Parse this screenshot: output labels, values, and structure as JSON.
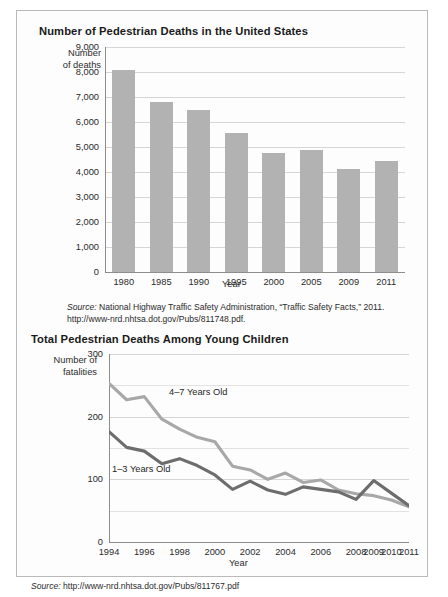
{
  "bar_section": {
    "title": "Number of Pedestrian Deaths in the United States",
    "y_caption_line1": "Number",
    "y_caption_line2": "of deaths",
    "x_axis_title": "Year",
    "source_line1": "Source: National Highway Traffic Safety Administration, “Traffic Safety Facts,” 2011.",
    "source_line2": "http://www-nrd.nhtsa.dot.gov/Pubs/811748.pdf.",
    "source_prefix": "Source:"
  },
  "line_section": {
    "title": "Total Pedestrian Deaths Among Young Children",
    "y_caption_line1": "Number of",
    "y_caption_line2": "fatalities",
    "x_axis_title": "Year",
    "label_older": "4–7 Years Old",
    "label_younger": "1–3 Years Old",
    "source_line1": "Source: http://www-nrd.nhtsa.dot.gov/Pubs/811767.pdf",
    "source_prefix": "Source:"
  },
  "colors": {
    "bar_fill": "#b2b2b2",
    "line_older": "#a8a8a8",
    "line_younger": "#6d6d6d",
    "grid": "#d6d6d6",
    "axis": "#8d8d8d",
    "border": "#b9b9b9",
    "text": "#231f20"
  },
  "chart_data": [
    {
      "type": "bar",
      "title": "Number of Pedestrian Deaths in the United States",
      "xlabel": "Year",
      "ylabel": "Number of deaths",
      "categories": [
        "1980",
        "1985",
        "1990",
        "1995",
        "2000",
        "2005",
        "2009",
        "2011"
      ],
      "values": [
        8070,
        6800,
        6480,
        5580,
        4760,
        4890,
        4110,
        4430
      ],
      "ylim": [
        0,
        9000
      ],
      "yticks": [
        0,
        1000,
        2000,
        3000,
        4000,
        5000,
        6000,
        7000,
        8000,
        9000
      ],
      "ytick_labels": [
        "0",
        "1,000",
        "2,000",
        "3,000",
        "4,000",
        "5,000",
        "6,000",
        "7,000",
        "8,000",
        "9,000"
      ],
      "grid": true,
      "legend": "none"
    },
    {
      "type": "line",
      "title": "Total Pedestrian Deaths Among Young Children",
      "xlabel": "Year",
      "ylabel": "Number of fatalities",
      "categories": [
        "1994",
        "1995",
        "1996",
        "1997",
        "1998",
        "1999",
        "2000",
        "2001",
        "2002",
        "2003",
        "2004",
        "2005",
        "2006",
        "2007",
        "2008",
        "2009",
        "2010",
        "2011"
      ],
      "tick_labels": [
        "1994",
        "1996",
        "1998",
        "2000",
        "2002",
        "2004",
        "2006",
        "2008",
        "2009",
        "2010",
        "2011"
      ],
      "ylim": [
        0,
        300
      ],
      "yticks": [
        0,
        100,
        200,
        300
      ],
      "ytick_labels": [
        "0",
        "100",
        "200",
        "300"
      ],
      "minor_gridlines": [
        50,
        150,
        250
      ],
      "grid": true,
      "legend": "inline-labels",
      "series": [
        {
          "name": "4–7 Years Old",
          "color": "#a8a8a8",
          "values": [
            253,
            227,
            232,
            196,
            180,
            167,
            160,
            121,
            115,
            100,
            110,
            95,
            99,
            83,
            77,
            74,
            67,
            56
          ]
        },
        {
          "name": "1–3 Years Old",
          "color": "#6d6d6d",
          "values": [
            176,
            151,
            145,
            125,
            133,
            122,
            107,
            84,
            97,
            83,
            76,
            88,
            84,
            80,
            68,
            98,
            78,
            58
          ]
        }
      ]
    }
  ]
}
